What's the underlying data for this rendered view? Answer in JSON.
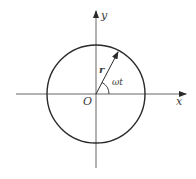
{
  "diagram": {
    "type": "circular-motion",
    "labels": {
      "x_axis": "x",
      "y_axis": "y",
      "origin": "O",
      "radius_vector": "r",
      "angle": "ωt"
    },
    "colors": {
      "stroke": "#2a2a2a",
      "axis": "#555555",
      "text": "#3a3a3a",
      "background": "#ffffff"
    },
    "geometry": {
      "origin": [
        96,
        94
      ],
      "circle_radius": 49,
      "vector_angle_deg": 62
    }
  }
}
